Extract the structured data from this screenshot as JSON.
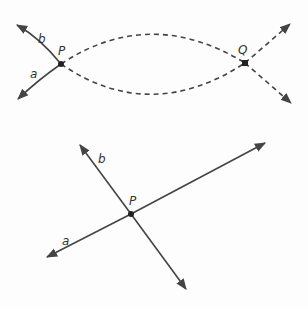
{
  "diagram": {
    "top_figure": {
      "description": "Two curves a and b through points P and Q",
      "labels": {
        "b": "b",
        "a": "a",
        "P": "P",
        "Q": "Q"
      },
      "points": {
        "P": [
          61,
          64
        ],
        "Q": [
          245,
          63
        ]
      },
      "line_style_between": "dashed"
    },
    "bottom_figure": {
      "description": "Two straight lines a and b intersecting at P",
      "labels": {
        "b": "b",
        "a": "a",
        "P": "P"
      },
      "points": {
        "P": [
          131,
          214
        ]
      }
    },
    "colors": {
      "stroke": "#444444",
      "point": "#222222",
      "background": "#fdfdfd"
    }
  }
}
